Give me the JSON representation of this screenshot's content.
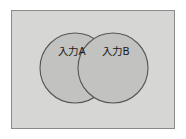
{
  "figure": {
    "type": "venn-diagram",
    "canvas": {
      "width": 186,
      "height": 139
    },
    "page_background": "#ffffff"
  },
  "frame": {
    "name": "diagram-frame",
    "fill": "#d6d6d4",
    "border_color": "#8a8a8a",
    "x": 11,
    "y": 10,
    "width": 164,
    "height": 119
  },
  "venn": {
    "circle_fill": "#c2c2c0",
    "circle_stroke": "#555555",
    "label_color": "#1b1b1b",
    "sets": [
      {
        "id": "set-a",
        "label": "入力A",
        "cx": 75,
        "cy": 68,
        "r": 35,
        "label_x": 72,
        "label_y": 52
      },
      {
        "id": "set-b",
        "label": "入力B",
        "cx": 113,
        "cy": 68,
        "r": 35,
        "label_x": 116,
        "label_y": 52
      }
    ]
  }
}
